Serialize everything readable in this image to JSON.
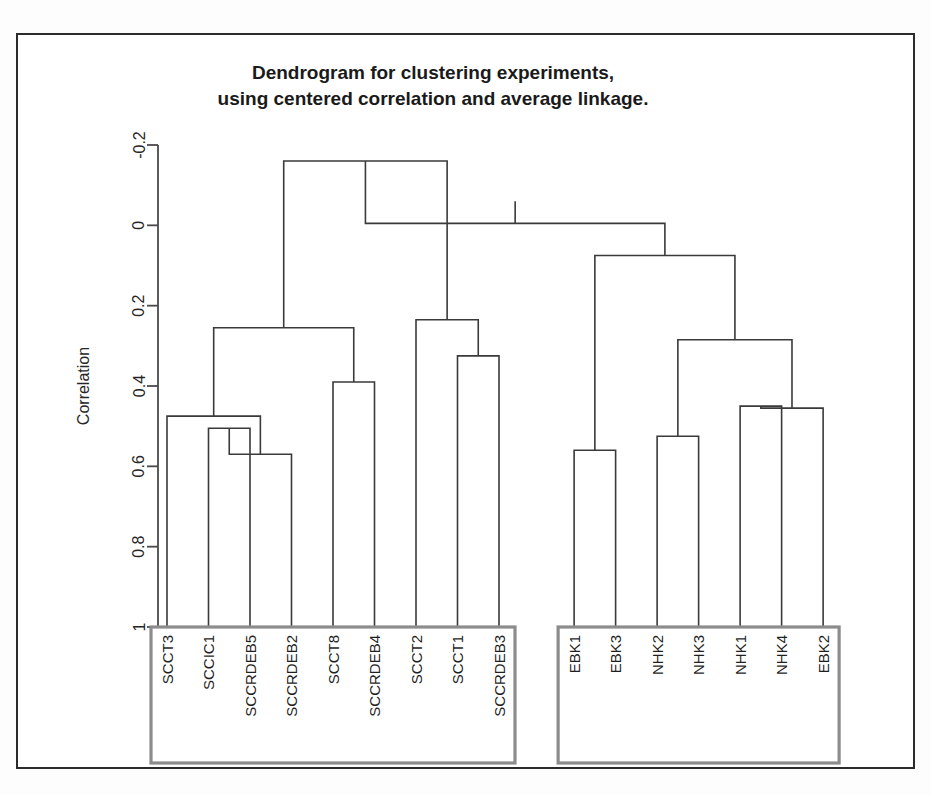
{
  "figure": {
    "title_line1": "Dendrogram for clustering experiments,",
    "title_line2": "using centered correlation and average linkage.",
    "axis_label": "Correlation",
    "frame_color": "#2b2b2b",
    "line_color": "#3a3a3a",
    "box_color": "#8c8c8c",
    "background": "#ffffff"
  },
  "chart_data": {
    "type": "dendrogram",
    "xlabel": "",
    "ylabel": "Correlation",
    "ylim": [
      -0.2,
      1.0
    ],
    "y_inverted": true,
    "grid": false,
    "legend": "none",
    "distance_metric": "centered correlation",
    "linkage": "average",
    "yticks": [
      -0.2,
      0,
      0.2,
      0.4,
      0.6,
      0.8,
      1
    ],
    "ytick_labels": [
      "-0.2",
      "0",
      "0.2",
      "0.4",
      "0.6",
      "0.8",
      "1"
    ],
    "leaves": [
      "SCCT3",
      "SCCIC1",
      "SCCRDEB5",
      "SCCRDEB2",
      "SCCT8",
      "SCCRDEB4",
      "SCCT2",
      "SCCT1",
      "SCCRDEB3",
      "EBK1",
      "EBK3",
      "NHK2",
      "NHK3",
      "NHK1",
      "NHK4",
      "EBK2"
    ],
    "merges": [
      {
        "id": "m1",
        "left": "SCCIC1",
        "right": "SCCRDEB5",
        "height": 0.505
      },
      {
        "id": "m2",
        "left": "m1",
        "right": "SCCRDEB2",
        "height": 0.57
      },
      {
        "id": "m3",
        "left": "SCCT3",
        "right": "m2",
        "height": 0.475
      },
      {
        "id": "m4",
        "left": "SCCT8",
        "right": "SCCRDEB4",
        "height": 0.39
      },
      {
        "id": "m5",
        "left": "m3",
        "right": "m4",
        "height": 0.255
      },
      {
        "id": "m6",
        "left": "SCCT1",
        "right": "SCCRDEB3",
        "height": 0.325
      },
      {
        "id": "m7",
        "left": "SCCT2",
        "right": "m6",
        "height": 0.235
      },
      {
        "id": "m8",
        "left": "m5",
        "right": "m7",
        "height": -0.16
      },
      {
        "id": "m9",
        "left": "EBK1",
        "right": "EBK3",
        "height": 0.56
      },
      {
        "id": "m10",
        "left": "NHK2",
        "right": "NHK3",
        "height": 0.525
      },
      {
        "id": "m11",
        "left": "NHK1",
        "right": "NHK4",
        "height": 0.45
      },
      {
        "id": "m12",
        "left": "m11",
        "right": "EBK2",
        "height": 0.455
      },
      {
        "id": "m13",
        "left": "m10",
        "right": "m12",
        "height": 0.285
      },
      {
        "id": "m14",
        "left": "m9",
        "right": "m13",
        "height": 0.075
      },
      {
        "id": "m15",
        "left": "m8",
        "right": "m14",
        "height": -0.005
      }
    ],
    "groups": [
      {
        "name": "group-box-left",
        "label": "",
        "first_leaf": "SCCT3",
        "last_leaf": "SCCRDEB3"
      },
      {
        "name": "group-box-right",
        "label": "",
        "first_leaf": "EBK1",
        "last_leaf": "EBK2"
      }
    ]
  },
  "geometry": {
    "plot_left": 140,
    "plot_right": 860,
    "axis_top_y": 110,
    "axis_bottom_y": 592,
    "leaf_start_x": 149,
    "leaf_spacing": 41.5,
    "group_gap": 3,
    "title_x": 415,
    "title_y1": 44,
    "title_y2": 70,
    "box_top": 592,
    "box_bottom": 728
  }
}
